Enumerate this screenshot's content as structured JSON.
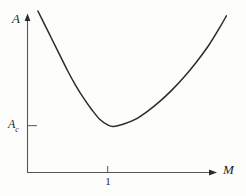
{
  "figure": {
    "background_color": "#fdfdfc",
    "ink_color": "#2b2b2b"
  },
  "labels": {
    "y_axis": "A",
    "x_axis": "M",
    "y_tick_ac_base": "A",
    "y_tick_ac_sub": "c",
    "x_tick_one": "1"
  },
  "chart_data": {
    "type": "line",
    "title": "",
    "subtitle": "",
    "xlabel": "M",
    "ylabel": "A",
    "grid": false,
    "legend": null,
    "axis_style": "arrowed-half-axes",
    "xlim": [
      0,
      2.6
    ],
    "ylim": [
      0,
      1.0
    ],
    "x_ticks": [
      {
        "value": 1,
        "label": "1"
      }
    ],
    "y_ticks": [
      {
        "value": 0.29,
        "label": "Ac"
      }
    ],
    "annotations": [
      {
        "text": "Ac",
        "x": 0.0,
        "y": 0.29,
        "note": "minimum value of A marked on the vertical axis"
      },
      {
        "text": "1",
        "x": 1.0,
        "y": 0.0,
        "note": "tick on horizontal axis near the curve minimum"
      }
    ],
    "series": [
      {
        "name": "A(M)",
        "color": "#2b2b2b",
        "minimum": {
          "x": 1.07,
          "y": 0.285
        },
        "x": [
          0.13,
          0.2,
          0.3,
          0.4,
          0.5,
          0.6,
          0.7,
          0.8,
          0.9,
          1.0,
          1.07,
          1.2,
          1.35,
          1.5,
          1.65,
          1.8,
          1.95,
          2.1,
          2.25,
          2.4,
          2.48
        ],
        "y": [
          1.0,
          0.93,
          0.83,
          0.73,
          0.63,
          0.54,
          0.46,
          0.39,
          0.33,
          0.295,
          0.285,
          0.3,
          0.33,
          0.38,
          0.44,
          0.51,
          0.59,
          0.68,
          0.78,
          0.9,
          0.97
        ]
      }
    ]
  }
}
